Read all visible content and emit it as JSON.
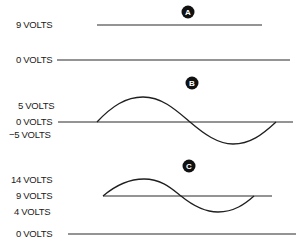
{
  "panels": [
    {
      "badge": "A",
      "labels": [
        "9 VOLTS",
        "0 VOLTS"
      ],
      "description": "Steady DC level at 9 volts above a 0 volt reference"
    },
    {
      "badge": "B",
      "labels": [
        "5 VOLTS",
        "0 VOLTS",
        "−5 VOLTS"
      ],
      "description": "AC sine wave swinging between +5 and −5 volts around 0 volts"
    },
    {
      "badge": "C",
      "labels": [
        "14 VOLTS",
        "9 VOLTS",
        "4 VOLTS",
        "0 VOLTS"
      ],
      "description": "AC sine wave riding on a 9 volt DC level, swinging between 14 and 4 volts"
    }
  ],
  "colors": {
    "ink": "#1f1f1f",
    "background": "#ffffff"
  }
}
